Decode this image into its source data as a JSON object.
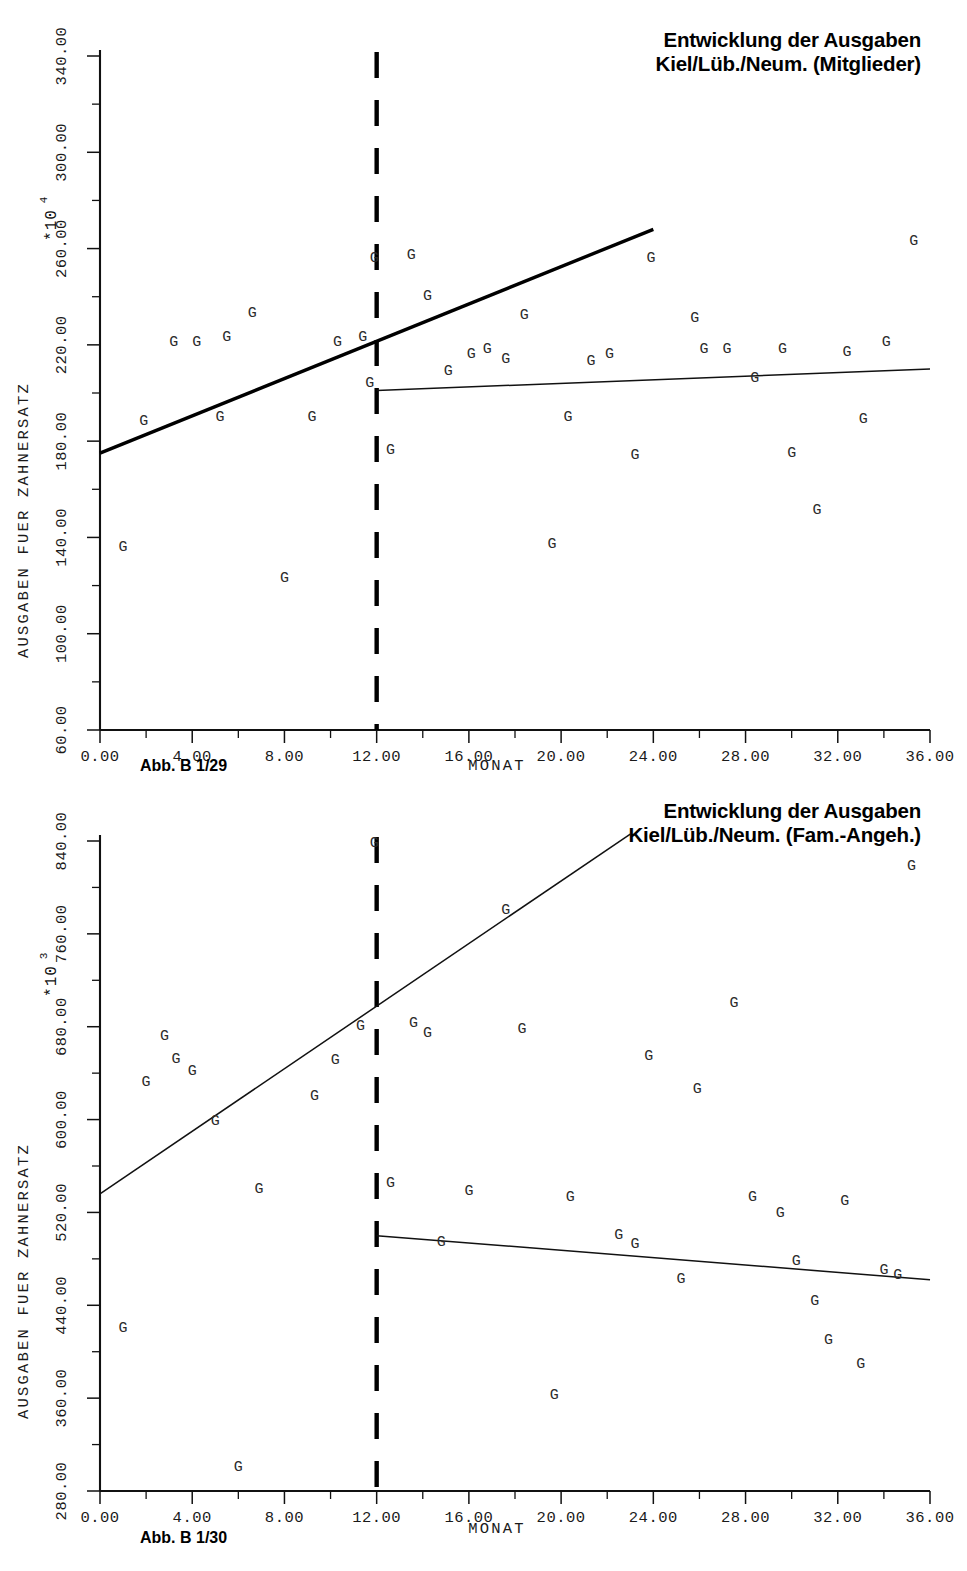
{
  "page": {
    "width": 967,
    "height": 1571,
    "background": "#ffffff",
    "ink_color": "#111111"
  },
  "charts": [
    {
      "id": "chart-mitglieder",
      "title": "Entwicklung der Ausgaben\nKiel/Lüb./Neum. (Mitglieder)",
      "caption": "Abb. B 1/29",
      "multiplier_base": "*10",
      "multiplier_exponent": "4",
      "ylabel": "AUSGABEN FUER ZAHNERSATZ",
      "xlabel": "MONAT",
      "xticks": [
        "0.00",
        "4.00",
        "8.00",
        "12.00",
        "16.00",
        "20.00",
        "24.00",
        "28.00",
        "32.00",
        "36.00"
      ],
      "yticks": [
        "60.00",
        "100.00",
        "140.00",
        "180.00",
        "220.00",
        "260.00",
        "300.00",
        "340.00"
      ]
    },
    {
      "id": "chart-fam-angeh",
      "title": "Entwicklung der Ausgaben\nKiel/Lüb./Neum. (Fam.-Angeh.)",
      "caption": "Abb. B 1/30",
      "multiplier_base": "*10",
      "multiplier_exponent": "3",
      "ylabel": "AUSGABEN FUER ZAHNERSATZ",
      "xlabel": "MONAT",
      "xticks": [
        "0.00",
        "4.00",
        "8.00",
        "12.00",
        "16.00",
        "20.00",
        "24.00",
        "28.00",
        "32.00",
        "36.00"
      ],
      "yticks": [
        "280.00",
        "360.00",
        "440.00",
        "520.00",
        "600.00",
        "680.00",
        "760.00",
        "840.00"
      ]
    }
  ],
  "chart_data": [
    {
      "type": "scatter",
      "id": "chart-mitglieder",
      "title": "Entwicklung der Ausgaben Kiel/Lüb./Neum. (Mitglieder)",
      "subtitle": "Abb. B 1/29",
      "xlabel": "MONAT",
      "ylabel": "AUSGABEN FUER ZAHNERSATZ",
      "y_multiplier": "*10^4",
      "xlim": [
        0,
        36
      ],
      "ylim": [
        60,
        340
      ],
      "xtick_step": 4,
      "ytick_step": 40,
      "minor_tick_step_x": 2,
      "minor_tick_step_y": 20,
      "grid": false,
      "legend": "none",
      "marker_glyph": "G",
      "annotations": [
        {
          "type": "vline",
          "name": "intervention-line",
          "x": 12,
          "style": "dashed",
          "label": ""
        }
      ],
      "series": [
        {
          "name": "Ausgaben fuer Zahnersatz (Mitglieder)",
          "points": [
            {
              "x": 1.0,
              "y": 136
            },
            {
              "x": 1.9,
              "y": 188
            },
            {
              "x": 3.2,
              "y": 221
            },
            {
              "x": 4.2,
              "y": 221
            },
            {
              "x": 5.2,
              "y": 190
            },
            {
              "x": 5.5,
              "y": 223
            },
            {
              "x": 6.6,
              "y": 233
            },
            {
              "x": 8.0,
              "y": 123
            },
            {
              "x": 9.2,
              "y": 190
            },
            {
              "x": 10.3,
              "y": 221
            },
            {
              "x": 11.4,
              "y": 223
            },
            {
              "x": 11.7,
              "y": 204
            },
            {
              "x": 11.9,
              "y": 256
            },
            {
              "x": 12.6,
              "y": 176
            },
            {
              "x": 13.5,
              "y": 257
            },
            {
              "x": 14.2,
              "y": 240
            },
            {
              "x": 15.1,
              "y": 209
            },
            {
              "x": 16.1,
              "y": 216
            },
            {
              "x": 16.8,
              "y": 218
            },
            {
              "x": 17.6,
              "y": 214
            },
            {
              "x": 18.4,
              "y": 232
            },
            {
              "x": 19.6,
              "y": 137
            },
            {
              "x": 20.3,
              "y": 190
            },
            {
              "x": 21.3,
              "y": 213
            },
            {
              "x": 22.1,
              "y": 216
            },
            {
              "x": 23.2,
              "y": 174
            },
            {
              "x": 23.9,
              "y": 256
            },
            {
              "x": 25.8,
              "y": 231
            },
            {
              "x": 26.2,
              "y": 218
            },
            {
              "x": 27.2,
              "y": 218
            },
            {
              "x": 28.4,
              "y": 206
            },
            {
              "x": 29.6,
              "y": 218
            },
            {
              "x": 30.0,
              "y": 175
            },
            {
              "x": 31.1,
              "y": 151
            },
            {
              "x": 32.4,
              "y": 217
            },
            {
              "x": 33.1,
              "y": 189
            },
            {
              "x": 34.1,
              "y": 221
            },
            {
              "x": 35.3,
              "y": 263
            }
          ]
        }
      ],
      "fits": [
        {
          "name": "pre-intervention-trend",
          "x0": 0,
          "y0": 175,
          "x1": 24,
          "y1": 268,
          "weight": "thick"
        },
        {
          "name": "post-intervention-trend",
          "x0": 12,
          "y0": 201,
          "x1": 36,
          "y1": 210,
          "weight": "thin"
        }
      ]
    },
    {
      "type": "scatter",
      "id": "chart-fam-angeh",
      "title": "Entwicklung der Ausgaben Kiel/Lüb./Neum. (Fam.-Angeh.)",
      "subtitle": "Abb. B 1/30",
      "xlabel": "MONAT",
      "ylabel": "AUSGABEN FUER ZAHNERSATZ",
      "y_multiplier": "*10^3",
      "xlim": [
        0,
        36
      ],
      "ylim": [
        280,
        840
      ],
      "xtick_step": 4,
      "ytick_step": 80,
      "minor_tick_step_x": 2,
      "minor_tick_step_y": 40,
      "grid": false,
      "legend": "none",
      "marker_glyph": "G",
      "annotations": [
        {
          "type": "vline",
          "name": "intervention-line",
          "x": 12,
          "style": "dashed",
          "label": ""
        }
      ],
      "series": [
        {
          "name": "Ausgaben fuer Zahnersatz (Fam.-Angeh.)",
          "points": [
            {
              "x": 1.0,
              "y": 420
            },
            {
              "x": 2.0,
              "y": 632
            },
            {
              "x": 2.8,
              "y": 672
            },
            {
              "x": 3.3,
              "y": 652
            },
            {
              "x": 4.0,
              "y": 641
            },
            {
              "x": 5.0,
              "y": 598
            },
            {
              "x": 6.0,
              "y": 300
            },
            {
              "x": 6.9,
              "y": 540
            },
            {
              "x": 9.3,
              "y": 620
            },
            {
              "x": 10.2,
              "y": 651
            },
            {
              "x": 11.3,
              "y": 680
            },
            {
              "x": 11.9,
              "y": 838
            },
            {
              "x": 12.6,
              "y": 545
            },
            {
              "x": 13.6,
              "y": 683
            },
            {
              "x": 14.2,
              "y": 674
            },
            {
              "x": 14.8,
              "y": 494
            },
            {
              "x": 16.0,
              "y": 538
            },
            {
              "x": 17.6,
              "y": 780
            },
            {
              "x": 18.3,
              "y": 678
            },
            {
              "x": 19.7,
              "y": 362
            },
            {
              "x": 20.4,
              "y": 533
            },
            {
              "x": 22.5,
              "y": 500
            },
            {
              "x": 23.2,
              "y": 492
            },
            {
              "x": 23.8,
              "y": 654
            },
            {
              "x": 25.2,
              "y": 462
            },
            {
              "x": 25.9,
              "y": 626
            },
            {
              "x": 27.5,
              "y": 700
            },
            {
              "x": 28.3,
              "y": 533
            },
            {
              "x": 29.5,
              "y": 519
            },
            {
              "x": 30.2,
              "y": 478
            },
            {
              "x": 31.0,
              "y": 443
            },
            {
              "x": 31.6,
              "y": 410
            },
            {
              "x": 32.3,
              "y": 529
            },
            {
              "x": 33.0,
              "y": 389
            },
            {
              "x": 34.0,
              "y": 470
            },
            {
              "x": 34.6,
              "y": 466
            },
            {
              "x": 35.2,
              "y": 818
            }
          ]
        }
      ],
      "fits": [
        {
          "name": "pre-intervention-trend",
          "x0": 0,
          "y0": 536,
          "x1": 23,
          "y1": 846,
          "weight": "thin"
        },
        {
          "name": "post-intervention-trend",
          "x0": 12,
          "y0": 500,
          "x1": 36,
          "y1": 462,
          "weight": "thin"
        }
      ]
    }
  ]
}
